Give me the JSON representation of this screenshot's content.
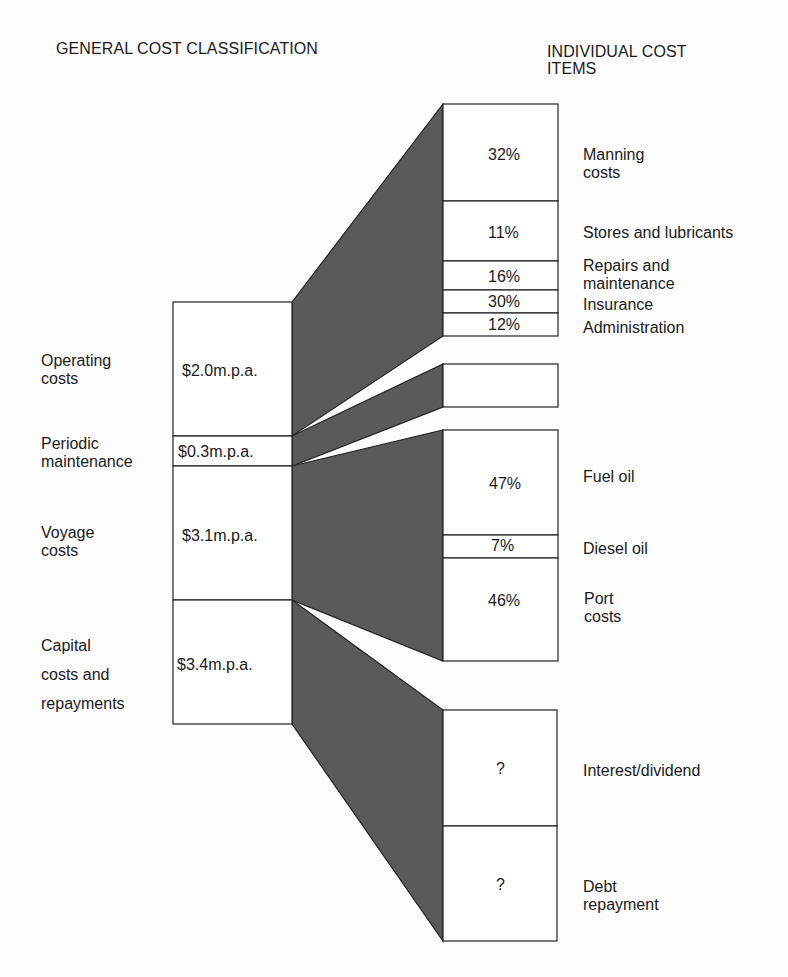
{
  "headers": {
    "left": "GENERAL COST CLASSIFICATION",
    "right_line1": "INDIVIDUAL COST",
    "right_line2": "ITEMS"
  },
  "colors": {
    "flow_fill": "#5a5a5a",
    "box_border": "#222222",
    "box_fill": "#ffffff",
    "text": "#1a1a1a"
  },
  "general": [
    {
      "label_lines": [
        "Operating",
        "costs"
      ],
      "value": "$2.0m.p.a."
    },
    {
      "label_lines": [
        "Periodic",
        "maintenance"
      ],
      "value": "$0.3m.p.a."
    },
    {
      "label_lines": [
        "Voyage",
        "costs"
      ],
      "value": "$3.1m.p.a."
    },
    {
      "label_lines": [
        "Capital",
        "costs and",
        "repayments"
      ],
      "value": "$3.4m.p.a."
    }
  ],
  "items": {
    "operating": [
      {
        "pct": "32%",
        "label_lines": [
          "Manning",
          "costs"
        ]
      },
      {
        "pct": "11%",
        "label_lines": [
          "Stores and lubricants"
        ]
      },
      {
        "pct": "16%",
        "label_lines": [
          "Repairs and",
          "maintenance"
        ]
      },
      {
        "pct": "30%",
        "label_lines": [
          "Insurance"
        ]
      },
      {
        "pct": "12%",
        "label_lines": [
          "Administration"
        ]
      }
    ],
    "periodic": [],
    "voyage": [
      {
        "pct": "47%",
        "label_lines": [
          "Fuel oil"
        ]
      },
      {
        "pct": "7%",
        "label_lines": [
          "Diesel oil"
        ]
      },
      {
        "pct": "46%",
        "label_lines": [
          "Port",
          "costs"
        ]
      }
    ],
    "capital": [
      {
        "pct": "?",
        "label_lines": [
          "Interest/dividend"
        ]
      },
      {
        "pct": "?",
        "label_lines": [
          "Debt",
          "repayment"
        ]
      }
    ]
  }
}
